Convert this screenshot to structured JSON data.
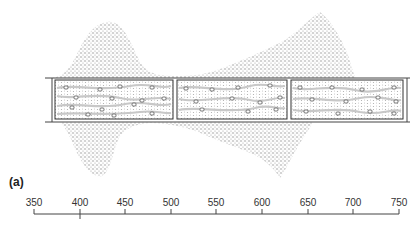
{
  "figure": {
    "panel_label": "(a)",
    "colors": {
      "stipple": "#9a9a9a",
      "lines": "#444444",
      "background": "#ffffff"
    },
    "compartments": 3
  },
  "scale": {
    "min": 350,
    "max": 750,
    "ticks": [
      "350",
      "400",
      "450",
      "500",
      "550",
      "600",
      "650",
      "700",
      "750"
    ],
    "marked_tick": "400"
  }
}
